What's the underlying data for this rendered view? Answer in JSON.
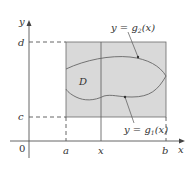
{
  "diagram": {
    "type": "region-of-integration",
    "region_label": "D",
    "axes": {
      "x_label": "x",
      "y_label": "y",
      "origin_label": "0"
    },
    "x_ticks": [
      "a",
      "x",
      "b"
    ],
    "y_ticks": [
      "d",
      "c"
    ],
    "curves": {
      "upper": {
        "prefix": "y = g",
        "sub": "2",
        "suffix": "(x)"
      },
      "lower": {
        "prefix": "y = g",
        "sub": "1",
        "suffix": "(x)"
      }
    },
    "colors": {
      "rectangle_fill": "#d9d9d9",
      "lines": "#555555",
      "background": "#ffffff"
    }
  }
}
